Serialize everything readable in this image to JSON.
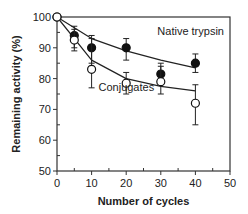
{
  "chart_data": {
    "type": "line",
    "title": "",
    "xlabel": "Number of cycles",
    "ylabel": "Remaining activity (%)",
    "xlim": [
      0,
      50
    ],
    "ylim": [
      50,
      100
    ],
    "xticks": [
      0,
      10,
      20,
      30,
      40,
      50
    ],
    "yticks": [
      50,
      60,
      70,
      80,
      90,
      100
    ],
    "grid": false,
    "legend": "inline annotations",
    "series": [
      {
        "name": "Native trypsin",
        "marker": "filled-circle",
        "x": [
          0,
          5,
          10,
          20,
          30,
          40
        ],
        "y": [
          100,
          94,
          90,
          90,
          81.5,
          85
        ],
        "err_low": [
          100,
          90,
          85,
          86,
          79,
          82
        ],
        "err_high": [
          100,
          97,
          94,
          93,
          85,
          88
        ],
        "fit_curve": [
          [
            0,
            100
          ],
          [
            10,
            93
          ],
          [
            20,
            89
          ],
          [
            30,
            86
          ],
          [
            40,
            83.5
          ]
        ]
      },
      {
        "name": "Conjugates",
        "marker": "open-circle",
        "x": [
          0,
          5,
          10,
          20,
          30,
          40
        ],
        "y": [
          100,
          92.5,
          83,
          78.5,
          79,
          72
        ],
        "err_low": [
          100,
          89,
          77,
          75,
          75,
          65
        ],
        "err_high": [
          100,
          96,
          93,
          82,
          84,
          78
        ],
        "fit_curve": [
          [
            0,
            100
          ],
          [
            10,
            86
          ],
          [
            20,
            80
          ],
          [
            30,
            77.5
          ],
          [
            40,
            76
          ]
        ]
      }
    ],
    "annotations": [
      {
        "text": "Native trypsin",
        "x": 29,
        "y": 94
      },
      {
        "text": "Conjugates",
        "x": 12,
        "y": 76
      }
    ]
  }
}
